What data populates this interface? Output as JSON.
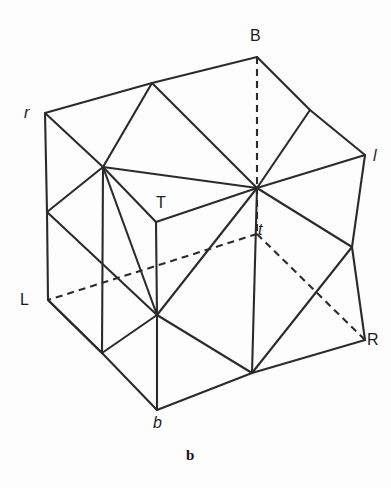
{
  "figure": {
    "caption": "b",
    "caption_position": {
      "x": 186,
      "y": 448
    },
    "canvas": {
      "width": 391,
      "height": 488
    },
    "stroke_color": "#2b2b2b",
    "background_color": "#fdfdfd",
    "text_color": "#1c1c1c"
  },
  "labels": [
    {
      "id": "label-B",
      "text": "B",
      "x": 250,
      "y": 28,
      "italic": false
    },
    {
      "id": "label-r",
      "text": "r",
      "x": 24,
      "y": 105,
      "italic": true
    },
    {
      "id": "label-l",
      "text": "l",
      "x": 373,
      "y": 148,
      "italic": true
    },
    {
      "id": "label-T",
      "text": "T",
      "x": 156,
      "y": 195,
      "italic": false
    },
    {
      "id": "label-t",
      "text": "t",
      "x": 258,
      "y": 222,
      "italic": true
    },
    {
      "id": "label-L",
      "text": "L",
      "x": 20,
      "y": 292,
      "italic": false
    },
    {
      "id": "label-R",
      "text": "R",
      "x": 367,
      "y": 332,
      "italic": false
    },
    {
      "id": "label-b",
      "text": "b",
      "x": 153,
      "y": 415,
      "italic": true
    }
  ],
  "vertices": {
    "r": {
      "x": 45,
      "y": 113
    },
    "B": {
      "x": 257,
      "y": 57
    },
    "l": {
      "x": 365,
      "y": 155
    },
    "R": {
      "x": 365,
      "y": 340
    },
    "b": {
      "x": 157,
      "y": 410
    },
    "L": {
      "x": 48,
      "y": 300
    },
    "hub_upper_left": {
      "x": 103,
      "y": 167
    },
    "T_corner": {
      "x": 156,
      "y": 222
    },
    "hub_center": {
      "x": 257,
      "y": 188
    },
    "left_mid": {
      "x": 47,
      "y": 212
    },
    "bottom_left": {
      "x": 102,
      "y": 353
    },
    "mid_left": {
      "x": 157,
      "y": 315
    },
    "diamond_bottom": {
      "x": 252,
      "y": 373
    },
    "top_mid": {
      "x": 152,
      "y": 83
    },
    "top_right": {
      "x": 310,
      "y": 110
    },
    "right_mid": {
      "x": 352,
      "y": 247
    },
    "t_node": {
      "x": 257,
      "y": 234
    }
  },
  "solid_edges": [
    {
      "name": "edge-r-topmid",
      "from": "r",
      "to": "top_mid"
    },
    {
      "name": "edge-topmid-B",
      "from": "top_mid",
      "to": "B"
    },
    {
      "name": "edge-B-topright",
      "from": "B",
      "to": "top_right"
    },
    {
      "name": "edge-topright-l",
      "from": "top_right",
      "to": "l"
    },
    {
      "name": "edge-l-rightmid",
      "from": "l",
      "to": "right_mid"
    },
    {
      "name": "edge-rightmid-R",
      "from": "right_mid",
      "to": "R"
    },
    {
      "name": "edge-R-diamondbottom",
      "from": "R",
      "to": "diamond_bottom"
    },
    {
      "name": "edge-diamondbottom-b",
      "from": "diamond_bottom",
      "to": "b"
    },
    {
      "name": "edge-b-bottomleft",
      "from": "b",
      "to": "bottom_left"
    },
    {
      "name": "edge-bottomleft-L",
      "from": "bottom_left",
      "to": "L"
    },
    {
      "name": "edge-L-leftmid",
      "from": "L",
      "to": "left_mid"
    },
    {
      "name": "edge-leftmid-r",
      "from": "left_mid",
      "to": "r"
    },
    {
      "name": "edge-r-hubupperleft",
      "from": "r",
      "to": "hub_upper_left"
    },
    {
      "name": "edge-topmid-hubupperleft",
      "from": "top_mid",
      "to": "hub_upper_left"
    },
    {
      "name": "edge-topmid-hubcenter",
      "from": "top_mid",
      "to": "hub_center"
    },
    {
      "name": "edge-hubupperleft-hubcenter",
      "from": "hub_upper_left",
      "to": "hub_center"
    },
    {
      "name": "edge-hubupperleft-leftmid",
      "from": "hub_upper_left",
      "to": "left_mid"
    },
    {
      "name": "edge-hubupperleft-Tcorner",
      "from": "hub_upper_left",
      "to": "T_corner"
    },
    {
      "name": "edge-hubupperleft-midleft",
      "from": "hub_upper_left",
      "to": "mid_left"
    },
    {
      "name": "edge-hubupperleft-bottomleft",
      "from": "hub_upper_left",
      "to": "bottom_left"
    },
    {
      "name": "edge-Tcorner-hubcenter",
      "from": "T_corner",
      "to": "hub_center"
    },
    {
      "name": "edge-Tcorner-midleft",
      "from": "T_corner",
      "to": "mid_left"
    },
    {
      "name": "edge-B-hubcenter-visible",
      "from": "top_right",
      "to": "hub_center"
    },
    {
      "name": "edge-hubcenter-topright2",
      "from": "hub_center",
      "to": "l"
    },
    {
      "name": "edge-hubcenter-rightmid",
      "from": "hub_center",
      "to": "right_mid"
    },
    {
      "name": "edge-hubcenter-midleft",
      "from": "hub_center",
      "to": "mid_left"
    },
    {
      "name": "edge-hubcenter-diamondbottom",
      "from": "hub_center",
      "to": "diamond_bottom"
    },
    {
      "name": "edge-midleft-bottomleft",
      "from": "mid_left",
      "to": "bottom_left"
    },
    {
      "name": "edge-midleft-b",
      "from": "mid_left",
      "to": "b"
    },
    {
      "name": "edge-midleft-diamondbottom",
      "from": "mid_left",
      "to": "diamond_bottom"
    },
    {
      "name": "edge-diamondbottom-rightmid",
      "from": "diamond_bottom",
      "to": "right_mid"
    },
    {
      "name": "edge-leftmid-midleft",
      "from": "left_mid",
      "to": "mid_left"
    },
    {
      "name": "edge-L-b-lower",
      "from": "L",
      "to": "bottom_left"
    }
  ],
  "dashed_edges": [
    {
      "name": "dashed-B-hubcenter",
      "from": "B",
      "to": "hub_center"
    },
    {
      "name": "dashed-hubcenter-tnode",
      "from": "hub_center",
      "to": "t_node"
    },
    {
      "name": "dashed-tnode-L",
      "from": "t_node",
      "to": "L"
    },
    {
      "name": "dashed-tnode-R",
      "from": "t_node",
      "to": "R"
    }
  ]
}
